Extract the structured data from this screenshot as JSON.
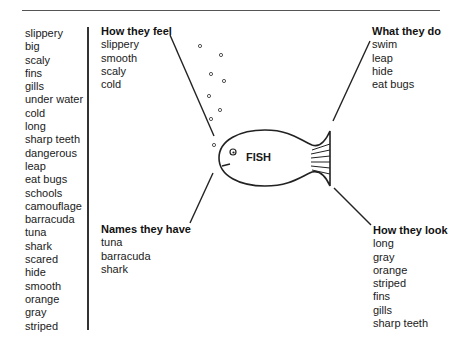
{
  "word_bank": [
    "slippery",
    "big",
    "scaly",
    "fins",
    "gills",
    "under water",
    "cold",
    "long",
    "sharp teeth",
    "dangerous",
    "leap",
    "eat bugs",
    "schools",
    "camouflage",
    "barracuda",
    "tuna",
    "shark",
    "scared",
    "hide",
    "smooth",
    "orange",
    "gray",
    "striped"
  ],
  "center": {
    "label": "FISH"
  },
  "groups": {
    "feel": {
      "title": "How they feel",
      "items": [
        "slippery",
        "smooth",
        "scaly",
        "cold"
      ]
    },
    "do": {
      "title": "What they do",
      "items": [
        "swim",
        "leap",
        "hide",
        "eat bugs"
      ]
    },
    "names": {
      "title": "Names they have",
      "items": [
        "tuna",
        "barracuda",
        "shark"
      ]
    },
    "look": {
      "title": "How they look",
      "items": [
        "long",
        "gray",
        "orange",
        "striped",
        "fins",
        "gills",
        "sharp teeth"
      ]
    }
  }
}
